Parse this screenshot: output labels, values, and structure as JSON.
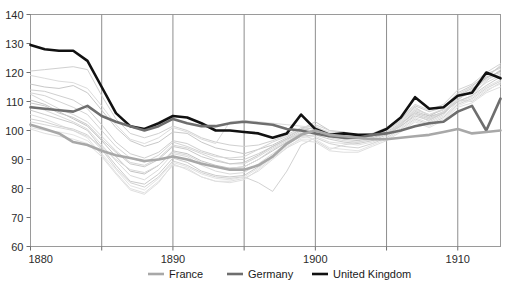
{
  "chart_data": {
    "type": "line",
    "title": "",
    "subtitle": "",
    "xlabel": "",
    "ylabel": "",
    "xlim": [
      1880,
      1913
    ],
    "ylim": [
      60,
      140
    ],
    "ytick_values": [
      60,
      70,
      80,
      90,
      100,
      110,
      120,
      130,
      140
    ],
    "ytick_labels": [
      "60",
      "70",
      "80",
      "90",
      "100",
      "110",
      "120",
      "130",
      "140"
    ],
    "xtick_values": [
      1880,
      1885,
      1890,
      1895,
      1900,
      1905,
      1910
    ],
    "xtick_labels": [
      "1880",
      "",
      "1890",
      "",
      "1900",
      "",
      "1910"
    ],
    "grid": "vertical-only",
    "legend_position": "bottom-center",
    "x": [
      1880,
      1881,
      1882,
      1883,
      1884,
      1885,
      1886,
      1887,
      1888,
      1889,
      1890,
      1891,
      1892,
      1893,
      1894,
      1895,
      1896,
      1897,
      1898,
      1899,
      1900,
      1901,
      1902,
      1903,
      1904,
      1905,
      1906,
      1907,
      1908,
      1909,
      1910,
      1911,
      1912,
      1913
    ],
    "series": [
      {
        "name": "United Kingdom",
        "color": "#111111",
        "width": 2.6,
        "highlight": true,
        "values": [
          129.5,
          128.0,
          127.5,
          127.5,
          124.0,
          115.0,
          106.0,
          101.5,
          100.5,
          102.5,
          105.0,
          104.5,
          102.5,
          100.0,
          100.0,
          99.5,
          99.0,
          97.5,
          99.0,
          105.5,
          100.5,
          98.5,
          99.0,
          98.5,
          98.5,
          100.5,
          104.5,
          111.5,
          107.5,
          108.0,
          112.0,
          113.0,
          120.0,
          118.0
        ]
      },
      {
        "name": "Germany",
        "color": "#6e6e6e",
        "width": 2.6,
        "highlight": true,
        "values": [
          108.0,
          107.5,
          107.0,
          106.5,
          108.5,
          105.0,
          103.0,
          101.5,
          100.0,
          101.5,
          104.0,
          102.5,
          101.5,
          101.5,
          102.5,
          103.0,
          102.5,
          102.0,
          100.5,
          100.0,
          99.0,
          98.0,
          97.5,
          97.5,
          98.5,
          99.0,
          100.0,
          101.5,
          102.5,
          103.0,
          106.5,
          108.5,
          100.0,
          111.0
        ]
      },
      {
        "name": "France",
        "color": "#a8a8a8",
        "width": 2.6,
        "highlight": true,
        "values": [
          102.0,
          100.5,
          99.0,
          96.0,
          95.0,
          93.0,
          91.5,
          90.5,
          89.5,
          90.0,
          91.0,
          90.0,
          88.5,
          87.5,
          86.5,
          86.5,
          88.0,
          91.0,
          95.5,
          98.5,
          100.0,
          98.5,
          98.0,
          97.5,
          97.0,
          97.0,
          97.5,
          98.0,
          98.5,
          99.5,
          100.5,
          99.0,
          99.5,
          100.0
        ]
      },
      {
        "name": "background-1",
        "color": "#d0d0d0",
        "width": 1,
        "highlight": false,
        "values": [
          120.5,
          121.0,
          121.5,
          122.0,
          121.0,
          112.0,
          104.0,
          99.0,
          97.5,
          99.0,
          101.5,
          100.0,
          97.5,
          96.0,
          95.0,
          94.5,
          95.0,
          96.5,
          98.5,
          101.0,
          100.5,
          99.0,
          98.5,
          98.0,
          98.5,
          100.0,
          103.5,
          108.0,
          105.0,
          106.0,
          110.0,
          112.0,
          117.0,
          121.0
        ]
      },
      {
        "name": "background-2",
        "color": "#c8c8c8",
        "width": 1,
        "highlight": false,
        "values": [
          116.0,
          115.0,
          114.5,
          115.5,
          113.0,
          107.0,
          101.0,
          96.5,
          94.5,
          96.0,
          99.5,
          99.0,
          96.0,
          94.0,
          93.0,
          92.0,
          93.5,
          95.0,
          97.5,
          100.5,
          103.0,
          100.0,
          99.5,
          98.0,
          98.0,
          99.5,
          102.5,
          106.0,
          104.5,
          106.5,
          110.5,
          114.0,
          118.5,
          120.0
        ]
      },
      {
        "name": "background-3",
        "color": "#cfcfcf",
        "width": 1,
        "highlight": false,
        "values": [
          114.0,
          113.5,
          112.0,
          110.5,
          107.5,
          102.0,
          96.0,
          92.0,
          90.5,
          92.5,
          96.5,
          95.5,
          93.0,
          91.5,
          90.0,
          90.0,
          92.0,
          94.5,
          97.0,
          99.0,
          99.5,
          98.0,
          97.5,
          97.0,
          97.5,
          99.0,
          101.5,
          105.5,
          104.0,
          106.0,
          111.0,
          113.5,
          118.0,
          122.5
        ]
      },
      {
        "name": "background-4",
        "color": "#d6d6d6",
        "width": 1,
        "highlight": false,
        "values": [
          112.5,
          110.0,
          107.5,
          105.5,
          103.0,
          98.0,
          93.0,
          89.0,
          88.0,
          90.5,
          95.0,
          94.0,
          92.0,
          90.0,
          88.5,
          88.5,
          91.0,
          94.0,
          96.5,
          99.5,
          101.5,
          99.0,
          98.0,
          97.5,
          98.0,
          100.0,
          103.0,
          107.5,
          105.5,
          107.0,
          112.5,
          115.0,
          119.5,
          121.5
        ]
      },
      {
        "name": "background-5",
        "color": "#c4c4c4",
        "width": 1,
        "highlight": false,
        "values": [
          110.5,
          109.0,
          106.5,
          104.0,
          101.5,
          96.5,
          91.0,
          86.0,
          85.0,
          88.0,
          93.0,
          92.0,
          89.5,
          88.0,
          87.0,
          87.5,
          90.0,
          93.0,
          96.0,
          99.0,
          100.5,
          98.5,
          97.0,
          96.5,
          97.5,
          99.0,
          102.0,
          106.5,
          105.0,
          107.5,
          112.0,
          114.5,
          118.0,
          120.5
        ]
      },
      {
        "name": "background-6",
        "color": "#dadada",
        "width": 1,
        "highlight": false,
        "values": [
          108.5,
          107.0,
          105.0,
          103.0,
          100.5,
          95.0,
          89.5,
          84.5,
          83.0,
          86.5,
          92.0,
          91.0,
          88.0,
          86.0,
          85.0,
          85.5,
          88.5,
          92.0,
          95.5,
          98.5,
          99.5,
          97.5,
          96.5,
          96.0,
          97.0,
          99.0,
          102.5,
          107.0,
          104.0,
          106.5,
          111.5,
          113.0,
          116.5,
          119.0
        ]
      },
      {
        "name": "background-7",
        "color": "#cbcbcb",
        "width": 1,
        "highlight": false,
        "values": [
          107.0,
          105.5,
          104.0,
          102.5,
          100.0,
          94.0,
          88.0,
          82.5,
          81.5,
          85.0,
          90.5,
          89.0,
          86.0,
          84.5,
          84.0,
          84.5,
          87.5,
          91.5,
          95.0,
          98.0,
          98.5,
          97.0,
          96.0,
          95.5,
          96.5,
          98.5,
          101.5,
          105.0,
          103.5,
          106.0,
          110.0,
          112.0,
          115.5,
          118.5
        ]
      },
      {
        "name": "background-8",
        "color": "#e0e0e0",
        "width": 1,
        "highlight": false,
        "values": [
          105.5,
          104.0,
          102.0,
          100.0,
          97.5,
          91.5,
          85.5,
          80.0,
          78.5,
          82.5,
          88.0,
          87.0,
          84.0,
          82.5,
          82.0,
          83.0,
          86.5,
          90.5,
          94.0,
          97.5,
          98.0,
          96.0,
          95.5,
          95.0,
          96.0,
          98.0,
          101.0,
          104.5,
          102.5,
          105.0,
          109.5,
          111.5,
          115.0,
          117.5
        ]
      },
      {
        "name": "background-9",
        "color": "#d2d2d2",
        "width": 1,
        "highlight": false,
        "values": [
          104.0,
          103.0,
          101.5,
          100.5,
          98.5,
          93.5,
          87.0,
          82.0,
          80.5,
          84.0,
          89.5,
          88.0,
          85.5,
          84.0,
          83.5,
          84.0,
          82.0,
          79.0,
          86.0,
          95.0,
          97.5,
          95.5,
          94.5,
          94.0,
          95.5,
          97.5,
          100.5,
          104.0,
          102.0,
          104.5,
          109.0,
          111.0,
          114.5,
          117.0
        ]
      },
      {
        "name": "background-10",
        "color": "#dcdcdc",
        "width": 1,
        "highlight": false,
        "values": [
          119.0,
          118.0,
          117.0,
          116.5,
          114.5,
          108.5,
          102.0,
          97.0,
          95.5,
          97.5,
          101.0,
          99.5,
          97.0,
          95.5,
          103.0,
          103.5,
          103.0,
          102.5,
          102.0,
          101.5,
          101.0,
          99.5,
          99.0,
          98.5,
          99.0,
          100.5,
          103.0,
          107.0,
          105.5,
          107.5,
          112.0,
          113.5,
          117.5,
          119.5
        ]
      },
      {
        "name": "background-11",
        "color": "#c9c9c9",
        "width": 1,
        "highlight": false,
        "values": [
          109.5,
          108.5,
          106.0,
          104.5,
          102.0,
          97.0,
          92.5,
          88.5,
          87.5,
          90.0,
          94.5,
          93.5,
          91.0,
          89.5,
          88.5,
          89.0,
          91.5,
          94.5,
          97.0,
          100.0,
          101.0,
          99.0,
          98.5,
          98.0,
          98.5,
          100.5,
          104.0,
          108.5,
          106.5,
          108.0,
          113.0,
          115.5,
          119.0,
          122.0
        ]
      },
      {
        "name": "background-12",
        "color": "#d8d8d8",
        "width": 1,
        "highlight": false,
        "values": [
          103.0,
          102.0,
          101.0,
          100.0,
          98.0,
          94.5,
          90.0,
          86.5,
          85.5,
          88.0,
          92.5,
          91.5,
          89.0,
          87.5,
          87.0,
          87.5,
          90.0,
          93.5,
          96.0,
          99.0,
          96.5,
          93.5,
          95.0,
          96.0,
          97.0,
          99.0,
          102.0,
          106.0,
          103.0,
          105.5,
          110.5,
          110.0,
          113.5,
          116.5
        ]
      },
      {
        "name": "background-13",
        "color": "#e4e4e4",
        "width": 1,
        "highlight": false,
        "values": [
          101.0,
          100.0,
          99.5,
          98.5,
          96.5,
          92.0,
          86.5,
          81.0,
          79.5,
          83.5,
          89.0,
          87.5,
          85.0,
          83.5,
          83.0,
          84.0,
          87.0,
          91.0,
          94.5,
          97.0,
          97.0,
          94.0,
          93.5,
          93.0,
          95.0,
          97.0,
          100.0,
          103.5,
          101.5,
          104.0,
          108.5,
          110.5,
          114.0,
          116.0
        ]
      },
      {
        "name": "background-14",
        "color": "#d4d4d4",
        "width": 1,
        "highlight": false,
        "values": [
          113.0,
          112.0,
          110.0,
          108.0,
          105.5,
          100.0,
          94.5,
          90.5,
          89.0,
          91.5,
          96.0,
          94.5,
          92.5,
          91.0,
          90.5,
          91.0,
          93.5,
          96.0,
          98.0,
          100.5,
          102.0,
          100.0,
          99.0,
          98.5,
          99.0,
          101.0,
          104.5,
          109.0,
          107.0,
          109.0,
          114.0,
          116.0,
          120.0,
          123.0
        ]
      },
      {
        "name": "background-15",
        "color": "#dfdfdf",
        "width": 1,
        "highlight": false,
        "values": [
          100.5,
          99.0,
          98.0,
          97.0,
          95.5,
          91.0,
          85.0,
          79.5,
          78.0,
          82.0,
          88.5,
          86.5,
          84.0,
          82.5,
          82.5,
          83.5,
          86.0,
          90.0,
          94.0,
          96.5,
          96.0,
          93.0,
          92.5,
          92.5,
          94.5,
          96.5,
          99.5,
          103.0,
          101.0,
          103.5,
          108.0,
          109.5,
          113.0,
          115.0
        ]
      }
    ]
  },
  "legend": {
    "items": [
      {
        "label": "France",
        "color": "#a8a8a8"
      },
      {
        "label": "Germany",
        "color": "#6e6e6e"
      },
      {
        "label": "United Kingdom",
        "color": "#111111"
      }
    ]
  },
  "axes": {
    "y_labels": [
      "140",
      "130",
      "120",
      "110",
      "100",
      "90",
      "80",
      "70",
      "60"
    ],
    "x_labels": [
      "1880",
      "1890",
      "1900",
      "1910"
    ]
  }
}
